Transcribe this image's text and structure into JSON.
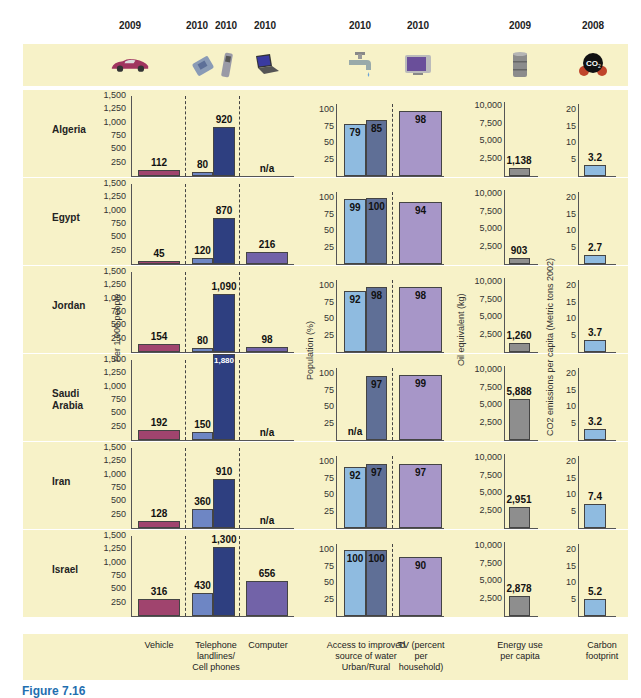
{
  "years": [
    "2009",
    "2010",
    "2010",
    "2010",
    "2010",
    "2010",
    "2009",
    "2008"
  ],
  "icons": [
    "car-icon",
    "landline-phone-icon",
    "cell-phone-icon",
    "laptop-icon",
    "water-tap-icon",
    "tv-icon",
    "oil-barrel-icon",
    "co2-molecule-icon"
  ],
  "axis_labels": {
    "per_people": "Per 1,000 people",
    "population": "Population (%)",
    "oil": "Oil equivalent (kg)",
    "co2": "CO2 emissions per capita (Metric tons 2002)"
  },
  "ticks": {
    "per_people": [
      "1,500",
      "1,250",
      "1,000",
      "750",
      "500",
      "250"
    ],
    "population": [
      "100",
      "75",
      "50",
      "25"
    ],
    "oil": [
      "10,000",
      "7,500",
      "5,000",
      "2,500"
    ],
    "co2": [
      "20",
      "15",
      "10",
      "5"
    ]
  },
  "footer": {
    "vehicle": "Vehicle",
    "telephone": "Telephone landlines/ Cell phones",
    "computer": "Computer",
    "water": "Access to improved source of water Urban/Rural",
    "tv": "TV (percent per household)",
    "energy": "Energy use per capita",
    "carbon": "Carbon footprint"
  },
  "caption": "Figure 7.16",
  "colors": {
    "band": "#f7f2c8",
    "vehicle": "#a0446e",
    "landline": "#6e86c4",
    "cell": "#2e3f80",
    "computer": "#7263a8",
    "water_urban": "#8fbbe0",
    "water_rural": "#5f6f96",
    "tv": "#a796c8",
    "energy": "#8e8e8e",
    "carbon": "#8fbbe0"
  },
  "chart_data": {
    "type": "bar",
    "title": "",
    "categories": [
      "Algeria",
      "Egypt",
      "Jordan",
      "Saudi Arabia",
      "Iran",
      "Israel"
    ],
    "series": [
      {
        "name": "Vehicle (per 1,000 people, 2009)",
        "values": [
          112,
          45,
          154,
          192,
          128,
          316
        ]
      },
      {
        "name": "Telephone landlines (per 1,000 people, 2010)",
        "values": [
          80,
          120,
          80,
          150,
          360,
          430
        ]
      },
      {
        "name": "Cell phones (per 1,000 people, 2010)",
        "values": [
          920,
          870,
          1090,
          1880,
          910,
          1300
        ]
      },
      {
        "name": "Computer (per 1,000 people, 2010)",
        "values": [
          null,
          216,
          98,
          null,
          null,
          656
        ]
      },
      {
        "name": "Access to improved water - Urban (%, 2010)",
        "values": [
          79,
          99,
          92,
          null,
          92,
          100
        ]
      },
      {
        "name": "Access to improved water - Rural (%, 2010)",
        "values": [
          85,
          100,
          98,
          97,
          97,
          100
        ]
      },
      {
        "name": "TV (percent per household, 2010)",
        "values": [
          98,
          94,
          98,
          99,
          97,
          90
        ]
      },
      {
        "name": "Energy use per capita (kg oil equivalent, 2009)",
        "values": [
          1138,
          903,
          1260,
          5888,
          2951,
          2878
        ]
      },
      {
        "name": "Carbon footprint (CO2 metric tons per capita, 2008)",
        "values": [
          3.2,
          2.7,
          3.7,
          3.2,
          7.4,
          5.2
        ]
      }
    ],
    "labels": {
      "vehicle": [
        "112",
        "45",
        "154",
        "192",
        "128",
        "316"
      ],
      "landline": [
        "80",
        "120",
        "80",
        "150",
        "360",
        "430"
      ],
      "cell": [
        "920",
        "870",
        "1,090",
        "1,880",
        "910",
        "1,300"
      ],
      "computer": [
        "n/a",
        "216",
        "98",
        "n/a",
        "n/a",
        "656"
      ],
      "urban": [
        "79",
        "99",
        "92",
        "n/a",
        "92",
        "100"
      ],
      "rural": [
        "85",
        "100",
        "98",
        "97",
        "97",
        "100"
      ],
      "tv": [
        "98",
        "94",
        "98",
        "99",
        "97",
        "90"
      ],
      "energy": [
        "1,138",
        "903",
        "1,260",
        "5,888",
        "2,951",
        "2,878"
      ],
      "carbon": [
        "3.2",
        "2.7",
        "3.7",
        "3.2",
        "7.4",
        "5.2"
      ]
    },
    "ylabels": [
      "Per 1,000 people",
      "Population (%)",
      "Oil equivalent (kg)",
      "CO2 emissions per capita (Metric tons 2002)"
    ],
    "ylims": {
      "per_people": [
        0,
        1500
      ],
      "population": [
        0,
        100
      ],
      "oil": [
        0,
        10000
      ],
      "co2": [
        0,
        20
      ]
    },
    "grid": false,
    "legend": "none"
  }
}
